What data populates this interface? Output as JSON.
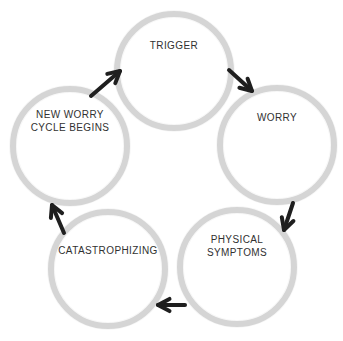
{
  "diagram": {
    "name": "Worry Cycle",
    "colors": {
      "background": "#ffffff",
      "circle-border": "#d5d5d5",
      "label-text": "#313131",
      "arrow": "#1f1f1f"
    },
    "nodes": [
      {
        "id": "trigger",
        "label": "TRIGGER",
        "lines": [
          "TRIGGER"
        ]
      },
      {
        "id": "worry",
        "label": "WORRY",
        "lines": [
          "WORRY"
        ]
      },
      {
        "id": "physical-symptoms",
        "label": "PHYSICAL SYMPTOMS",
        "lines": [
          "PHYSICAL",
          "SYMPTOMS"
        ]
      },
      {
        "id": "catastrophizing",
        "label": "CATASTROPHIZING",
        "lines": [
          "CATASTROPHIZING"
        ]
      },
      {
        "id": "new-worry-cycle-begins",
        "label": "NEW WORRY CYCLE BEGINS",
        "lines": [
          "NEW WORRY",
          "CYCLE BEGINS"
        ]
      }
    ],
    "arrows": [
      {
        "from": "new-worry-cycle-begins",
        "to": "trigger",
        "direction": "northeast"
      },
      {
        "from": "trigger",
        "to": "worry",
        "direction": "southeast"
      },
      {
        "from": "worry",
        "to": "physical-symptoms",
        "direction": "south"
      },
      {
        "from": "physical-symptoms",
        "to": "catastrophizing",
        "direction": "west"
      },
      {
        "from": "catastrophizing",
        "to": "new-worry-cycle-begins",
        "direction": "north"
      }
    ]
  }
}
